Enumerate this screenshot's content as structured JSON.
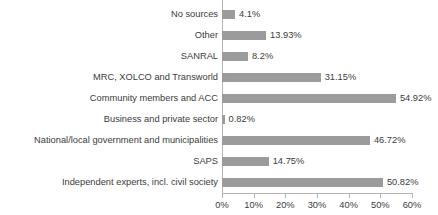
{
  "chart_data": {
    "type": "bar",
    "orientation": "horizontal",
    "title": "",
    "subtitle": "",
    "xlabel": "",
    "ylabel": "",
    "xlim": [
      0,
      60
    ],
    "grid": false,
    "legend": null,
    "tick_suffix": "%",
    "xticks": [
      0,
      10,
      20,
      30,
      40,
      50,
      60
    ],
    "xtick_labels": [
      "0%",
      "10%",
      "20%",
      "30%",
      "40%",
      "50%",
      "60%"
    ],
    "bar_color": "#9b9b9b",
    "text_color": "#3b3b3b",
    "axis_color": "#b4b4b4",
    "categories": [
      "No sources",
      "Other",
      "SANRAL",
      "MRC, XOLCO and Transworld",
      "Community members and ACC",
      "Business and private sector",
      "National/local government and municipalities",
      "SAPS",
      "Independent experts, incl. civil society"
    ],
    "values": [
      4.1,
      13.93,
      8.2,
      31.15,
      54.92,
      0.82,
      46.72,
      14.75,
      50.82
    ],
    "value_labels": [
      "4.1%",
      "13.93%",
      "8.2%",
      "31.15%",
      "54.92%",
      "0.82%",
      "46.72%",
      "14.75%",
      "50.82%"
    ]
  }
}
